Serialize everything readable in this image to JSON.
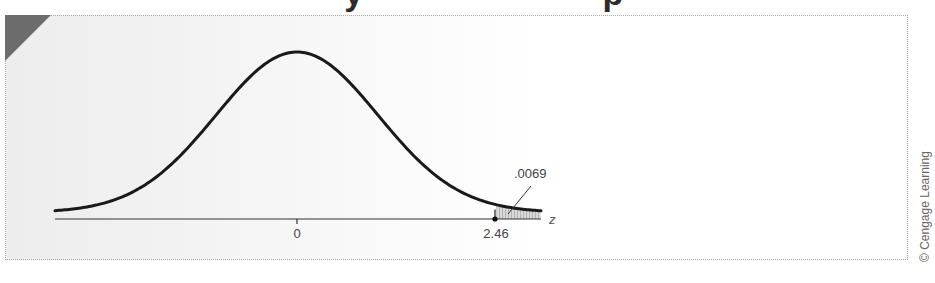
{
  "heading": {
    "text": "Figure ... probability",
    "visible": "clipped-descenders-only"
  },
  "credit": "© Cengage Learning",
  "colors": {
    "curve": "#1a1a1a",
    "axis": "#333333",
    "shade": "#c8c8c8",
    "corner_flag": "#6c6c6c",
    "label": "#444444"
  },
  "chart_data": {
    "type": "area",
    "title": "",
    "xlabel": "z",
    "ylabel": "",
    "x_ticks": [
      {
        "value": 0,
        "label": "0"
      },
      {
        "value": 2.46,
        "label": "2.46"
      }
    ],
    "xlim": [
      -2.6,
      2.6
    ],
    "distribution": "standard normal",
    "shaded_region": {
      "from": 2.46,
      "to": "infinity",
      "area": 0.0069
    },
    "annotations": [
      {
        "text": ".0069",
        "points_to": "shaded upper tail"
      }
    ],
    "grid": false,
    "legend": null
  },
  "labels": {
    "tick_zero": "0",
    "tick_cutoff": "2.46",
    "axis_var": "z",
    "tail_area": ".0069"
  }
}
